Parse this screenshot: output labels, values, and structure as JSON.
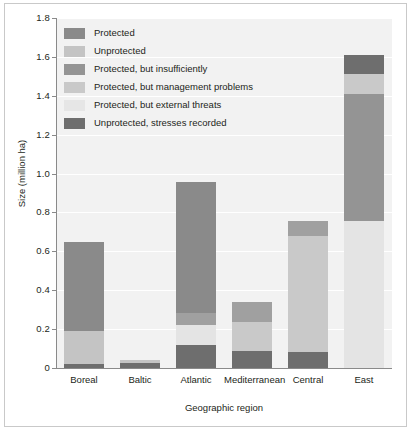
{
  "chart_data": {
    "type": "bar",
    "stacked": true,
    "title": "",
    "xlabel": "Geographic region",
    "ylabel": "Size (million ha)",
    "ylim": [
      0,
      1.8
    ],
    "ytick_labels": [
      "0",
      "0.2",
      "0.4",
      "0.6",
      "0.8",
      "1.0",
      "1.2",
      "1.4",
      "1.6",
      "1.8"
    ],
    "ytick_values": [
      0,
      0.2,
      0.4,
      0.6,
      0.8,
      1.0,
      1.2,
      1.4,
      1.6,
      1.8
    ],
    "grid": true,
    "grid_axis": "y",
    "legend_position": "upper-left-inside",
    "categories": [
      "Boreal",
      "Baltic",
      "Atlantic",
      "Mediterranean",
      "Central",
      "East"
    ],
    "series": [
      {
        "name": "Protected",
        "color": "#8a8a8a",
        "values": [
          0.46,
          0.0,
          0.79,
          0.0,
          0.0,
          0.0
        ]
      },
      {
        "name": "Unprotected",
        "color": "#c4c4c4",
        "values": [
          0.17,
          0.0,
          0.0,
          0.0,
          0.0,
          0.0
        ]
      },
      {
        "name": "Protected, but insufficiently",
        "color": "#949494",
        "values": [
          0.0,
          0.0,
          0.06,
          0.1,
          0.08,
          0.68
        ]
      },
      {
        "name": "Protected, but management problems",
        "color": "#c9c9c9",
        "values": [
          0.0,
          0.0,
          0.0,
          0.15,
          0.6,
          0.1
        ]
      },
      {
        "name": "Protected, but external threats",
        "color": "#e4e4e4",
        "values": [
          0.0,
          0.0,
          0.1,
          0.0,
          0.0,
          0.755
        ]
      },
      {
        "name": "Unprotected, stresses recorded",
        "color": "#6e6e6e",
        "values": [
          0.02,
          0.04,
          0.12,
          0.08,
          0.08,
          0.1
        ]
      }
    ],
    "bar_totals": [
      0.65,
      0.04,
      1.07,
      0.33,
      0.76,
      1.635
    ],
    "bars": [
      {
        "category": "Boreal",
        "total": 0.65,
        "segments": [
          {
            "series": "Protected",
            "color": "#8a8a8a",
            "from": 0.19,
            "to": 0.65
          },
          {
            "series": "Unprotected",
            "color": "#c4c4c4",
            "from": 0.02,
            "to": 0.19
          },
          {
            "series": "Unprotected, stresses recorded",
            "color": "#6e6e6e",
            "from": 0.0,
            "to": 0.02
          }
        ]
      },
      {
        "category": "Baltic",
        "total": 0.04,
        "segments": [
          {
            "series": "Unprotected",
            "color": "#c4c4c4",
            "from": 0.025,
            "to": 0.04
          },
          {
            "series": "Unprotected, stresses recorded",
            "color": "#6e6e6e",
            "from": 0.0,
            "to": 0.025
          }
        ]
      },
      {
        "category": "Atlantic",
        "total": 0.955,
        "segments": [
          {
            "series": "Protected",
            "color": "#8a8a8a",
            "from": 0.285,
            "to": 0.955
          },
          {
            "series": "Protected, but insufficiently",
            "color": "#a0a0a0",
            "from": 0.22,
            "to": 0.285
          },
          {
            "series": "Protected, but external threats",
            "color": "#e4e4e4",
            "from": 0.12,
            "to": 0.22
          },
          {
            "series": "Unprotected, stresses recorded",
            "color": "#6e6e6e",
            "from": 0.0,
            "to": 0.12
          }
        ]
      },
      {
        "category": "Mediterranean",
        "total": 0.337,
        "segments": [
          {
            "series": "Protected, but insufficiently",
            "color": "#a0a0a0",
            "from": 0.235,
            "to": 0.337
          },
          {
            "series": "Protected, but management problems",
            "color": "#c9c9c9",
            "from": 0.085,
            "to": 0.235
          },
          {
            "series": "Unprotected, stresses recorded",
            "color": "#6e6e6e",
            "from": 0.0,
            "to": 0.085
          }
        ]
      },
      {
        "category": "Central",
        "total": 0.757,
        "segments": [
          {
            "series": "Protected, but insufficiently",
            "color": "#a0a0a0",
            "from": 0.68,
            "to": 0.757
          },
          {
            "series": "Protected, but management problems",
            "color": "#c9c9c9",
            "from": 0.08,
            "to": 0.68
          },
          {
            "series": "Unprotected, stresses recorded",
            "color": "#6e6e6e",
            "from": 0.0,
            "to": 0.08
          }
        ]
      },
      {
        "category": "East",
        "total": 1.612,
        "segments": [
          {
            "series": "Unprotected, stresses recorded",
            "color": "#6e6e6e",
            "from": 1.51,
            "to": 1.612
          },
          {
            "series": "Protected, but management problems",
            "color": "#c9c9c9",
            "from": 1.41,
            "to": 1.51
          },
          {
            "series": "Protected, but insufficiently",
            "color": "#949494",
            "from": 0.755,
            "to": 1.41
          },
          {
            "series": "Protected, but external threats",
            "color": "#e4e4e4",
            "from": 0.0,
            "to": 0.755
          }
        ]
      }
    ]
  },
  "legend": {
    "items": [
      {
        "label": "Protected",
        "color": "#8a8a8a"
      },
      {
        "label": "Unprotected",
        "color": "#c4c4c4"
      },
      {
        "label": "Protected, but insufficiently",
        "color": "#949494"
      },
      {
        "label": "Protected, but management problems",
        "color": "#c9c9c9"
      },
      {
        "label": "Protected, but external threats",
        "color": "#e6e6e6"
      },
      {
        "label": "Unprotected, stresses recorded",
        "color": "#6e6e6e"
      }
    ]
  },
  "axes": {
    "x_title": "Geographic region",
    "y_title": "Size (million ha)"
  },
  "colors": {
    "plot_background": "#f2f2f2",
    "grid": "#ffffff",
    "axis": "#8a8a8a",
    "text": "#231f20",
    "frame": "#c9c9c9"
  }
}
